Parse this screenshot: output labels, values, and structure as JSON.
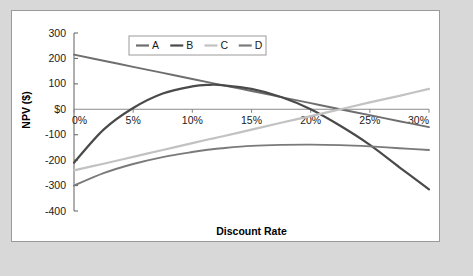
{
  "figure": {
    "background_color": "#d8d8d8",
    "panel_color": "#ffffff",
    "panel_border_color": "#9a9a9a"
  },
  "chart_data": {
    "type": "line",
    "title": "",
    "xlabel": "Discount Rate",
    "ylabel": "NPV ($)",
    "xlim": [
      0,
      30
    ],
    "ylim": [
      -400,
      300
    ],
    "grid": false,
    "legend_position": "top-center",
    "x_tick_labels": [
      "0%",
      "5%",
      "10%",
      "15%",
      "20%",
      "25%",
      "30%"
    ],
    "x_ticks": [
      0,
      5,
      10,
      15,
      20,
      25,
      30
    ],
    "y_tick_labels": [
      "300",
      "200",
      "100",
      "$0",
      "-100",
      "-200",
      "-300",
      "-400"
    ],
    "y_ticks": [
      300,
      200,
      100,
      0,
      -100,
      -200,
      -300,
      -400
    ],
    "x": [
      0,
      2.5,
      5,
      7.5,
      10,
      11.5,
      12.5,
      15,
      17.5,
      20,
      22.5,
      25,
      27.5,
      30
    ],
    "series": [
      {
        "name": "A",
        "color": "#6e6e6e",
        "width": 1.9,
        "values": [
          215,
          191,
          167,
          143,
          119,
          105,
          95,
          72,
          48,
          24,
          0,
          -23,
          -47,
          -70
        ]
      },
      {
        "name": "B",
        "color": "#4a4a4a",
        "width": 2.2,
        "values": [
          -210,
          -80,
          5,
          62,
          90,
          96,
          95,
          80,
          48,
          0,
          -65,
          -140,
          -228,
          -315
        ]
      },
      {
        "name": "C",
        "color": "#c2c2c2",
        "width": 2.2,
        "values": [
          -240,
          -214,
          -187,
          -160,
          -133,
          -117,
          -107,
          -80,
          -53,
          -27,
          0,
          27,
          53,
          80
        ]
      },
      {
        "name": "D",
        "color": "#7a7a7a",
        "width": 1.9,
        "values": [
          -300,
          -251,
          -215,
          -188,
          -168,
          -158,
          -153,
          -144,
          -140,
          -139,
          -141,
          -146,
          -153,
          -160
        ]
      }
    ],
    "legend_entries": [
      {
        "label": "A",
        "color": "#6e6e6e"
      },
      {
        "label": "B",
        "color": "#4a4a4a"
      },
      {
        "label": "C",
        "color": "#c2c2c2"
      },
      {
        "label": "D",
        "color": "#7a7a7a"
      }
    ]
  }
}
